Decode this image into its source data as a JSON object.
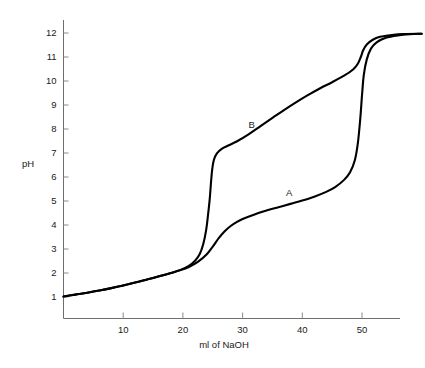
{
  "chart_data": {
    "type": "line",
    "title": "",
    "subtitle": "",
    "xlabel": "ml of NaOH",
    "ylabel": "pH",
    "xlim": [
      0,
      60
    ],
    "ylim": [
      0.4,
      12.6
    ],
    "grid": false,
    "legend_position": "inline-annotation",
    "xticks": [
      10,
      20,
      30,
      40,
      50
    ],
    "xtick_labels": [
      "10",
      "20",
      "30",
      "40",
      "50"
    ],
    "yticks": [
      1,
      2,
      3,
      4,
      5,
      6,
      7,
      8,
      9,
      10,
      11,
      12
    ],
    "ytick_labels": [
      "1",
      "2",
      "3",
      "4",
      "5",
      "6",
      "7",
      "8",
      "9",
      "10",
      "11",
      "12"
    ],
    "annotations": [
      {
        "text": "B",
        "x": 31.5,
        "y": 8.05
      },
      {
        "text": "A",
        "x": 37.8,
        "y": 5.2
      }
    ],
    "series": [
      {
        "name": "A",
        "label": "A",
        "color": "#000000",
        "points": [
          [
            0.0,
            1.02
          ],
          [
            2.0,
            1.1
          ],
          [
            4.0,
            1.18
          ],
          [
            6.0,
            1.27
          ],
          [
            8.0,
            1.37
          ],
          [
            10.0,
            1.48
          ],
          [
            12.0,
            1.6
          ],
          [
            14.0,
            1.73
          ],
          [
            16.0,
            1.86
          ],
          [
            18.0,
            2.0
          ],
          [
            19.5,
            2.11
          ],
          [
            21.0,
            2.25
          ],
          [
            22.5,
            2.46
          ],
          [
            24.0,
            2.78
          ],
          [
            25.0,
            3.1
          ],
          [
            26.0,
            3.45
          ],
          [
            27.0,
            3.74
          ],
          [
            28.0,
            3.96
          ],
          [
            29.0,
            4.12
          ],
          [
            30.0,
            4.25
          ],
          [
            32.0,
            4.44
          ],
          [
            34.0,
            4.6
          ],
          [
            36.0,
            4.74
          ],
          [
            38.0,
            4.88
          ],
          [
            40.0,
            5.02
          ],
          [
            42.0,
            5.18
          ],
          [
            44.0,
            5.38
          ],
          [
            45.5,
            5.58
          ],
          [
            47.0,
            5.88
          ],
          [
            48.0,
            6.2
          ],
          [
            48.8,
            6.7
          ],
          [
            49.3,
            7.4
          ],
          [
            49.7,
            8.4
          ],
          [
            50.0,
            9.4
          ],
          [
            50.3,
            10.25
          ],
          [
            50.8,
            10.9
          ],
          [
            51.5,
            11.35
          ],
          [
            52.5,
            11.62
          ],
          [
            54.0,
            11.8
          ],
          [
            56.0,
            11.9
          ],
          [
            58.0,
            11.95
          ],
          [
            60.0,
            11.97
          ]
        ]
      },
      {
        "name": "B",
        "label": "B",
        "color": "#000000",
        "points": [
          [
            0.0,
            1.02
          ],
          [
            2.0,
            1.1
          ],
          [
            4.0,
            1.18
          ],
          [
            6.0,
            1.27
          ],
          [
            8.0,
            1.37
          ],
          [
            10.0,
            1.48
          ],
          [
            12.0,
            1.6
          ],
          [
            14.0,
            1.73
          ],
          [
            16.0,
            1.86
          ],
          [
            18.0,
            2.0
          ],
          [
            19.5,
            2.12
          ],
          [
            21.0,
            2.3
          ],
          [
            22.0,
            2.5
          ],
          [
            22.8,
            2.78
          ],
          [
            23.4,
            3.2
          ],
          [
            23.9,
            3.8
          ],
          [
            24.2,
            4.4
          ],
          [
            24.5,
            5.1
          ],
          [
            24.7,
            5.75
          ],
          [
            24.9,
            6.3
          ],
          [
            25.2,
            6.72
          ],
          [
            25.7,
            6.98
          ],
          [
            26.5,
            7.17
          ],
          [
            27.5,
            7.3
          ],
          [
            29.0,
            7.48
          ],
          [
            31.0,
            7.78
          ],
          [
            33.0,
            8.12
          ],
          [
            35.0,
            8.46
          ],
          [
            37.0,
            8.8
          ],
          [
            39.0,
            9.12
          ],
          [
            41.0,
            9.42
          ],
          [
            43.0,
            9.7
          ],
          [
            45.0,
            9.95
          ],
          [
            47.0,
            10.22
          ],
          [
            48.5,
            10.48
          ],
          [
            49.3,
            10.72
          ],
          [
            49.8,
            11.0
          ],
          [
            50.2,
            11.28
          ],
          [
            50.8,
            11.52
          ],
          [
            51.8,
            11.72
          ],
          [
            53.0,
            11.84
          ],
          [
            55.0,
            11.92
          ],
          [
            57.0,
            11.96
          ],
          [
            60.0,
            11.97
          ]
        ]
      }
    ]
  },
  "axes": {
    "y_axis_title": "pH",
    "x_axis_title": "ml of NaOH"
  }
}
